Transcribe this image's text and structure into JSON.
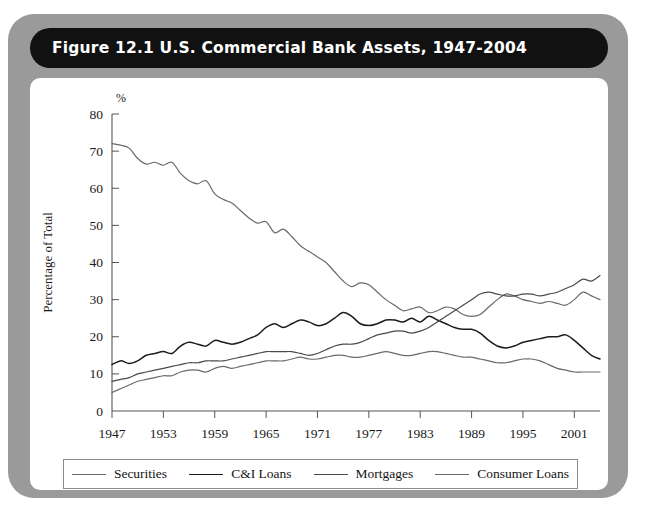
{
  "figure": {
    "title": "Figure 12.1   U.S. Commercial Bank Assets, 1947-2004",
    "frame_color": "#9a9a9a",
    "title_bar_color": "#111111",
    "panel_color": "#ffffff"
  },
  "chart_data": {
    "type": "line",
    "title": "U.S. Commercial Bank Assets, 1947-2004",
    "xlabel": "",
    "ylabel": "Percentage of Total",
    "unit_label": "%",
    "xlim": [
      1947,
      2004
    ],
    "ylim": [
      0,
      80
    ],
    "ytick_step": 10,
    "yticks": [
      0,
      10,
      20,
      30,
      40,
      50,
      60,
      70,
      80
    ],
    "xticks": [
      1947,
      1953,
      1959,
      1965,
      1971,
      1977,
      1983,
      1989,
      1995,
      2001
    ],
    "xtick_labels": [
      "1947",
      "1953",
      "1959",
      "1965",
      "1971",
      "1977",
      "1983",
      "1989",
      "1995",
      "2001"
    ],
    "grid": false,
    "legend_position": "bottom",
    "x": [
      1947,
      1948,
      1949,
      1950,
      1951,
      1952,
      1953,
      1954,
      1955,
      1956,
      1957,
      1958,
      1959,
      1960,
      1961,
      1962,
      1963,
      1964,
      1965,
      1966,
      1967,
      1968,
      1969,
      1970,
      1971,
      1972,
      1973,
      1974,
      1975,
      1976,
      1977,
      1978,
      1979,
      1980,
      1981,
      1982,
      1983,
      1984,
      1985,
      1986,
      1987,
      1988,
      1989,
      1990,
      1991,
      1992,
      1993,
      1994,
      1995,
      1996,
      1997,
      1998,
      1999,
      2000,
      2001,
      2002,
      2003,
      2004
    ],
    "series": [
      {
        "name": "Securities",
        "color": "#6a6a6a",
        "width": 1.2,
        "values": [
          72.0,
          71.6,
          70.8,
          68.0,
          66.5,
          67.0,
          66.2,
          67.0,
          64.0,
          62.0,
          61.2,
          62.0,
          58.5,
          57.0,
          56.0,
          54.0,
          52.0,
          50.6,
          51.0,
          48.0,
          49.0,
          47.0,
          44.5,
          43.0,
          41.5,
          40.0,
          37.5,
          35.0,
          33.5,
          34.5,
          34.0,
          32.0,
          30.0,
          28.5,
          27.0,
          27.5,
          28.0,
          26.5,
          27.0,
          28.0,
          27.5,
          26.0,
          25.5,
          26.0,
          28.0,
          30.0,
          31.5,
          31.0,
          30.0,
          29.5,
          29.0,
          29.5,
          29.0,
          28.5,
          30.0,
          32.0,
          31.0,
          30.0
        ]
      },
      {
        "name": "C&I Loans",
        "color": "#1c1c1c",
        "width": 1.5,
        "values": [
          12.5,
          13.5,
          12.8,
          13.5,
          15.0,
          15.5,
          16.0,
          15.5,
          17.5,
          18.5,
          18.0,
          17.5,
          19.0,
          18.5,
          18.0,
          18.5,
          19.5,
          20.5,
          22.5,
          23.5,
          22.5,
          23.5,
          24.5,
          24.0,
          23.0,
          23.5,
          25.0,
          26.5,
          25.5,
          23.5,
          23.0,
          23.5,
          24.5,
          24.5,
          24.0,
          25.0,
          24.0,
          25.5,
          24.5,
          23.5,
          22.5,
          22.0,
          22.0,
          21.0,
          19.0,
          17.5,
          17.0,
          17.5,
          18.5,
          19.0,
          19.5,
          20.0,
          20.0,
          20.5,
          19.0,
          17.0,
          15.0,
          14.0
        ]
      },
      {
        "name": "Mortgages",
        "color": "#4a4a4a",
        "width": 1.2,
        "values": [
          8.0,
          8.5,
          9.0,
          10.0,
          10.5,
          11.0,
          11.5,
          12.0,
          12.5,
          13.0,
          13.0,
          13.5,
          13.5,
          13.5,
          14.0,
          14.5,
          15.0,
          15.5,
          16.0,
          16.0,
          16.0,
          16.0,
          15.5,
          15.0,
          15.5,
          16.5,
          17.5,
          18.0,
          18.0,
          18.5,
          19.5,
          20.5,
          21.0,
          21.5,
          21.5,
          21.0,
          21.5,
          22.5,
          24.0,
          25.5,
          27.0,
          28.5,
          30.0,
          31.5,
          32.0,
          31.5,
          31.0,
          31.0,
          31.5,
          31.5,
          31.0,
          31.5,
          32.0,
          33.0,
          34.0,
          35.5,
          35.0,
          36.5
        ]
      },
      {
        "name": "Consumer Loans",
        "color": "#6a6a6a",
        "width": 1.2,
        "values": [
          5.0,
          6.0,
          7.0,
          8.0,
          8.5,
          9.0,
          9.5,
          9.5,
          10.5,
          11.0,
          11.0,
          10.5,
          11.5,
          12.0,
          11.5,
          12.0,
          12.5,
          13.0,
          13.5,
          13.5,
          13.5,
          14.0,
          14.5,
          14.0,
          14.0,
          14.5,
          15.0,
          15.0,
          14.5,
          14.5,
          15.0,
          15.5,
          16.0,
          15.5,
          15.0,
          15.0,
          15.5,
          16.0,
          16.0,
          15.5,
          15.0,
          14.5,
          14.5,
          14.0,
          13.5,
          13.0,
          13.0,
          13.5,
          14.0,
          14.0,
          13.5,
          12.5,
          11.5,
          11.0,
          10.5,
          10.5,
          10.5,
          10.5
        ]
      }
    ]
  },
  "legend": {
    "entries": [
      {
        "label": "Securities",
        "color": "#6a6a6a",
        "width": "1.2px"
      },
      {
        "label": "C&I Loans",
        "color": "#1c1c1c",
        "width": "1.8px"
      },
      {
        "label": "Mortgages",
        "color": "#4a4a4a",
        "width": "1.2px"
      },
      {
        "label": "Consumer Loans",
        "color": "#6a6a6a",
        "width": "1.2px"
      }
    ]
  }
}
